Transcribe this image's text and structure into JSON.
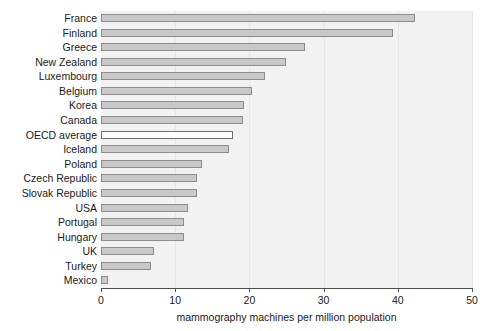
{
  "chart_data": {
    "type": "bar",
    "orientation": "horizontal",
    "title": "",
    "subtitle": "",
    "xlabel": "mammography machines per million population",
    "ylabel": "",
    "xlim": [
      0,
      50
    ],
    "xticks": [
      0,
      10,
      20,
      30,
      40,
      50
    ],
    "xtick_labels": [
      "0",
      "10",
      "20",
      "30",
      "40",
      "50"
    ],
    "grid": true,
    "grid_axis": "x",
    "legend": "none",
    "categories": [
      "France",
      "Finland",
      "Greece",
      "New Zealand",
      "Luxembourg",
      "Belgium",
      "Korea",
      "Canada",
      "OECD average",
      "Iceland",
      "Poland",
      "Czech Republic",
      "Slovak Republic",
      "USA",
      "Portugal",
      "Hungary",
      "UK",
      "Turkey",
      "Mexico"
    ],
    "values": [
      42.3,
      39.4,
      27.5,
      24.9,
      22.1,
      20.3,
      19.3,
      19.1,
      17.8,
      17.3,
      13.6,
      13.0,
      12.9,
      11.7,
      11.2,
      11.2,
      7.1,
      6.7,
      1.0
    ],
    "highlight_category": "OECD average",
    "bar_fill_color": "#c9c9c9",
    "bar_edge_color": "#8c8c8c",
    "highlight_fill_color": "#ffffff",
    "plot_background_color": "#f2f2f2",
    "gridline_color": "#e6e6e6",
    "axis_color": "#4d4d4d",
    "text_color": "#1a1a1a"
  }
}
